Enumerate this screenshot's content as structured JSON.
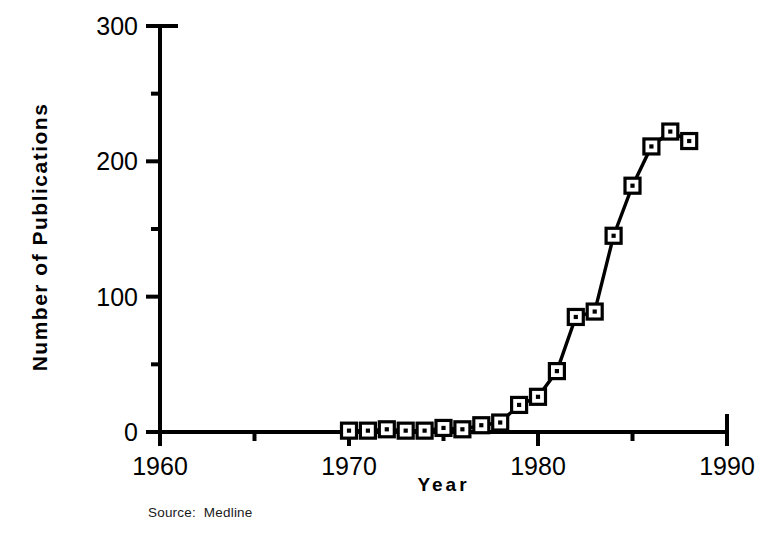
{
  "chart_data": {
    "type": "line",
    "title": "",
    "xlabel": "Year",
    "ylabel": "Number  of  Publications",
    "source_note": "Source:  Medline",
    "xlim": [
      1960,
      1990
    ],
    "ylim": [
      0,
      300
    ],
    "x_major_ticks": [
      1960,
      1970,
      1980,
      1990
    ],
    "x_minor_ticks": [
      1965,
      1975,
      1985
    ],
    "y_major_ticks": [
      0,
      100,
      200,
      300
    ],
    "y_minor_ticks": [
      50,
      150,
      250
    ],
    "x_tick_labels": [
      "1960",
      "1970",
      "1980",
      "1990"
    ],
    "y_tick_labels": [
      "0",
      "100",
      "200",
      "300"
    ],
    "grid": false,
    "legend": false,
    "marker": "open-square-with-dot",
    "series": [
      {
        "name": "Number of Publications",
        "x": [
          1970,
          1971,
          1972,
          1973,
          1974,
          1975,
          1976,
          1977,
          1978,
          1979,
          1980,
          1981,
          1982,
          1983,
          1984,
          1985,
          1986,
          1987,
          1988
        ],
        "values": [
          1,
          1,
          2,
          1,
          1,
          3,
          2,
          5,
          7,
          20,
          26,
          45,
          85,
          89,
          145,
          182,
          211,
          222,
          215
        ]
      }
    ]
  },
  "axis": {
    "ylabel_text": "Number  of  Publications",
    "xlabel_text": "Year",
    "source_text": "Source:  Medline"
  }
}
